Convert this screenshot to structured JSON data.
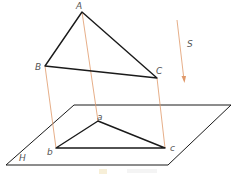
{
  "diagram": {
    "colors": {
      "edge": "#1a1a1a",
      "projector": "#e0996a",
      "label": "#555555",
      "watermark": "#f3e6bf"
    },
    "points": {
      "A": {
        "label": "A",
        "x": 82,
        "y": 12
      },
      "B": {
        "label": "B",
        "x": 45,
        "y": 66
      },
      "C": {
        "label": "C",
        "x": 157,
        "y": 78
      },
      "a": {
        "label": "a",
        "x": 98,
        "y": 121
      },
      "b": {
        "label": "b",
        "x": 56,
        "y": 148
      },
      "c": {
        "label": "c",
        "x": 165,
        "y": 148
      }
    },
    "plane": {
      "label": "H"
    },
    "direction": {
      "label": "S"
    }
  }
}
